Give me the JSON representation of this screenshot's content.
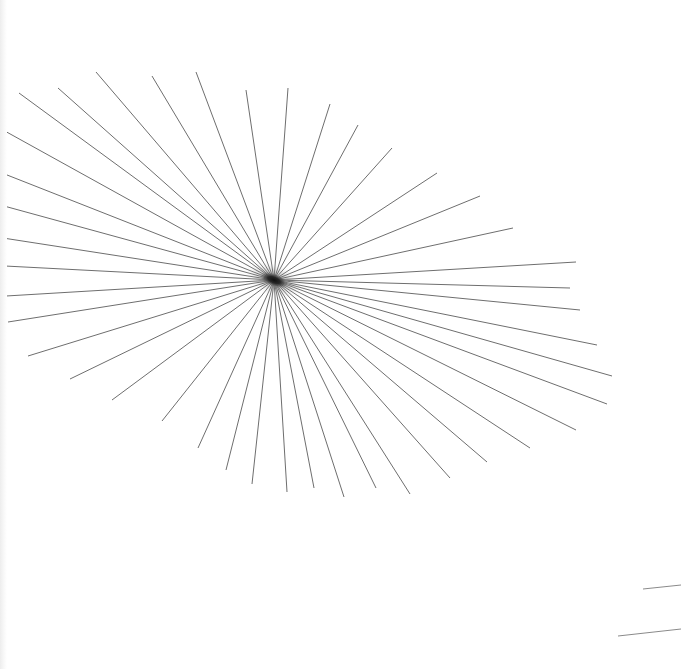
{
  "image": {
    "title": "Radial starburst line drawing",
    "description": "A fan of thin straight grey lines radiating from a single dark convergence point, plus two short horizontal line fragments near the bottom-right corner",
    "width": 681,
    "height": 669,
    "background_color": "#ffffff",
    "line_color": "#6e6e6e",
    "line_width": 1,
    "fragment_color": "#8a8a8a",
    "blob_color": "#161616",
    "ray_count": 40,
    "fragment_count": 2
  },
  "convergence_point": {
    "label": "convergence-center",
    "x": 274,
    "y": 280,
    "blob_width": 34,
    "blob_height": 15,
    "blob_rotation_deg": 22
  },
  "rays": [
    {
      "id": 1,
      "x1": 274,
      "y1": 280,
      "x2": 288,
      "y2": 88
    },
    {
      "id": 2,
      "x1": 274,
      "y1": 280,
      "x2": 246,
      "y2": 90
    },
    {
      "id": 3,
      "x1": 274,
      "y1": 280,
      "x2": 196,
      "y2": 72
    },
    {
      "id": 4,
      "x1": 274,
      "y1": 280,
      "x2": 152,
      "y2": 76
    },
    {
      "id": 5,
      "x1": 274,
      "y1": 280,
      "x2": 96,
      "y2": 72
    },
    {
      "id": 6,
      "x1": 274,
      "y1": 280,
      "x2": 58,
      "y2": 88
    },
    {
      "id": 7,
      "x1": 274,
      "y1": 280,
      "x2": 19,
      "y2": 93
    },
    {
      "id": 8,
      "x1": 274,
      "y1": 280,
      "x2": 3,
      "y2": 130
    },
    {
      "id": 9,
      "x1": 274,
      "y1": 280,
      "x2": 2,
      "y2": 173
    },
    {
      "id": 10,
      "x1": 274,
      "y1": 280,
      "x2": 4,
      "y2": 206
    },
    {
      "id": 11,
      "x1": 274,
      "y1": 280,
      "x2": 3,
      "y2": 238
    },
    {
      "id": 12,
      "x1": 274,
      "y1": 280,
      "x2": 5,
      "y2": 266
    },
    {
      "id": 13,
      "x1": 274,
      "y1": 280,
      "x2": 6,
      "y2": 296
    },
    {
      "id": 14,
      "x1": 274,
      "y1": 280,
      "x2": 8,
      "y2": 322
    },
    {
      "id": 15,
      "x1": 274,
      "y1": 280,
      "x2": 28,
      "y2": 356
    },
    {
      "id": 16,
      "x1": 274,
      "y1": 280,
      "x2": 70,
      "y2": 379
    },
    {
      "id": 17,
      "x1": 274,
      "y1": 280,
      "x2": 112,
      "y2": 400
    },
    {
      "id": 18,
      "x1": 274,
      "y1": 280,
      "x2": 162,
      "y2": 421
    },
    {
      "id": 19,
      "x1": 274,
      "y1": 280,
      "x2": 198,
      "y2": 448
    },
    {
      "id": 20,
      "x1": 274,
      "y1": 280,
      "x2": 226,
      "y2": 470
    },
    {
      "id": 21,
      "x1": 274,
      "y1": 280,
      "x2": 252,
      "y2": 484
    },
    {
      "id": 22,
      "x1": 274,
      "y1": 280,
      "x2": 287,
      "y2": 492
    },
    {
      "id": 23,
      "x1": 274,
      "y1": 280,
      "x2": 314,
      "y2": 488
    },
    {
      "id": 24,
      "x1": 274,
      "y1": 280,
      "x2": 344,
      "y2": 497
    },
    {
      "id": 25,
      "x1": 274,
      "y1": 280,
      "x2": 376,
      "y2": 488
    },
    {
      "id": 26,
      "x1": 274,
      "y1": 280,
      "x2": 410,
      "y2": 494
    },
    {
      "id": 27,
      "x1": 274,
      "y1": 280,
      "x2": 450,
      "y2": 478
    },
    {
      "id": 28,
      "x1": 274,
      "y1": 280,
      "x2": 487,
      "y2": 462
    },
    {
      "id": 29,
      "x1": 274,
      "y1": 280,
      "x2": 530,
      "y2": 448
    },
    {
      "id": 30,
      "x1": 274,
      "y1": 280,
      "x2": 576,
      "y2": 430
    },
    {
      "id": 31,
      "x1": 274,
      "y1": 280,
      "x2": 607,
      "y2": 404
    },
    {
      "id": 32,
      "x1": 274,
      "y1": 280,
      "x2": 612,
      "y2": 376
    },
    {
      "id": 33,
      "x1": 274,
      "y1": 280,
      "x2": 597,
      "y2": 345
    },
    {
      "id": 34,
      "x1": 274,
      "y1": 280,
      "x2": 580,
      "y2": 310
    },
    {
      "id": 35,
      "x1": 274,
      "y1": 280,
      "x2": 570,
      "y2": 288
    },
    {
      "id": 36,
      "x1": 274,
      "y1": 280,
      "x2": 576,
      "y2": 262
    },
    {
      "id": 37,
      "x1": 274,
      "y1": 280,
      "x2": 513,
      "y2": 228
    },
    {
      "id": 38,
      "x1": 274,
      "y1": 280,
      "x2": 480,
      "y2": 196
    },
    {
      "id": 39,
      "x1": 274,
      "y1": 280,
      "x2": 437,
      "y2": 173
    },
    {
      "id": 40,
      "x1": 274,
      "y1": 280,
      "x2": 392,
      "y2": 148
    },
    {
      "id": 41,
      "x1": 274,
      "y1": 280,
      "x2": 358,
      "y2": 125
    },
    {
      "id": 42,
      "x1": 274,
      "y1": 280,
      "x2": 330,
      "y2": 104
    }
  ],
  "fragments": [
    {
      "id": "fragment-upper",
      "x1": 643,
      "y1": 589,
      "x2": 681,
      "y2": 585
    },
    {
      "id": "fragment-lower",
      "x1": 618,
      "y1": 636,
      "x2": 681,
      "y2": 629
    }
  ]
}
